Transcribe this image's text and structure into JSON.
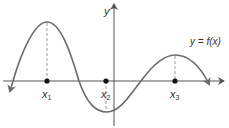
{
  "figure": {
    "function_label": "y = f(x)",
    "y_axis_label": "y",
    "points": [
      {
        "label": "x",
        "sub": "1",
        "x": 47
      },
      {
        "label": "x",
        "sub": "2",
        "x": 106
      },
      {
        "label": "x",
        "sub": "3",
        "x": 175
      }
    ],
    "colors": {
      "curve": "#6b6b6b",
      "axis": "#555555",
      "dash": "#9a9a9a",
      "dot": "#111111"
    }
  }
}
